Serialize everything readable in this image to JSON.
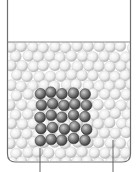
{
  "diagram": {
    "type": "particle-beaker",
    "colors": {
      "background": "#ffffff",
      "beaker_outline": "#6e6e6e",
      "liquid_surface": "#8a8a8a",
      "light_sphere_fill": "#f2f2f2",
      "light_sphere_shade": "#bdbdbd",
      "dark_sphere_fill": "#9a9a9a",
      "dark_sphere_shade": "#3a3a3a",
      "pointer_line": "#555555"
    },
    "beaker": {
      "left": 7,
      "right": 131,
      "top": 0,
      "bottom": 162,
      "corner_radius": 8,
      "fill_level": 42
    },
    "light_particles": {
      "radius": 5.6,
      "spacing_x": 11,
      "spacing_y": 9.6
    },
    "dark_cluster": {
      "rows": 5,
      "cols": 5,
      "origin_x": 40,
      "origin_y": 94,
      "spacing_x": 11.2,
      "spacing_y": 11.6,
      "radius": 5.4
    },
    "pointers": [
      {
        "name": "solute-pointer",
        "x": 40,
        "y1": 148,
        "y2": 172
      },
      {
        "name": "solvent-pointer",
        "x": 113,
        "y1": 140,
        "y2": 172
      }
    ]
  }
}
